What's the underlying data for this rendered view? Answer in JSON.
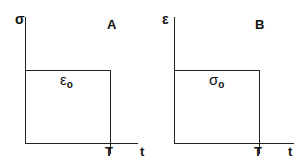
{
  "panels": [
    {
      "id": "A",
      "tag": "A",
      "y_axis_symbol": "σ",
      "x_axis_symbol": "t",
      "end_time_label": "T",
      "level_symbol": "ε",
      "level_subscript": "o"
    },
    {
      "id": "B",
      "tag": "B",
      "y_axis_symbol": "ε",
      "x_axis_symbol": "t",
      "end_time_label": "T",
      "level_symbol": "σ",
      "level_subscript": "o"
    }
  ],
  "colors": {
    "line": "#222222",
    "background": "#ffffff"
  }
}
